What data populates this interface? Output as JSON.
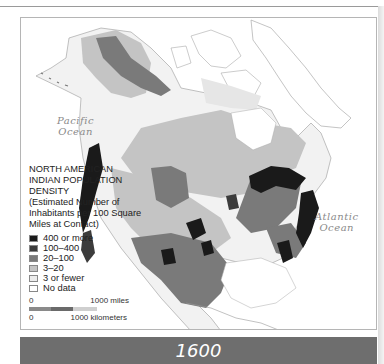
{
  "map": {
    "title_year": "1600",
    "oceans": [
      {
        "label_line1": "Pacific",
        "label_line2": "Ocean"
      },
      {
        "label_line1": "Atlantic",
        "label_line2": "Ocean"
      }
    ],
    "legend": {
      "title": "NORTH AMERICAN INDIAN POPULATION DENSITY",
      "subtitle": "(Estimated Number of Inhabitants per 100 Square Miles at Contact)",
      "items": [
        {
          "label": "400 or more",
          "color": "#1a1a1a"
        },
        {
          "label": "100–400",
          "color": "#3c3c3c"
        },
        {
          "label": "20–100",
          "color": "#7a7a7a"
        },
        {
          "label": "3–20",
          "color": "#c4c4c4"
        },
        {
          "label": "3 or fewer",
          "color": "#ececec"
        },
        {
          "label": "No data",
          "color": "#ffffff"
        }
      ]
    },
    "scale": {
      "miles_start": "0",
      "miles_end": "1000 miles",
      "km_start": "0",
      "km_end": "1000 kilometers"
    }
  }
}
